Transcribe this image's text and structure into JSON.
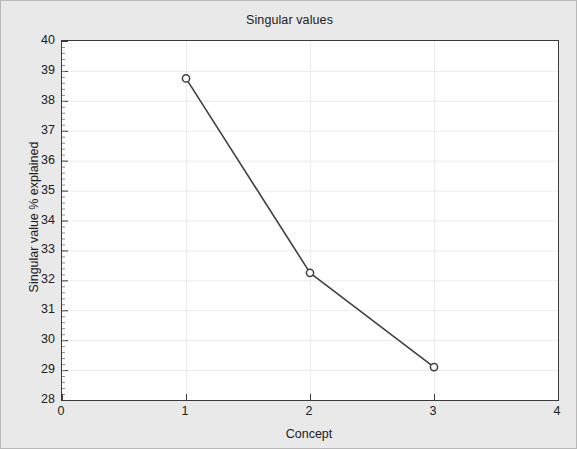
{
  "chart_data": {
    "type": "line",
    "title": "Singular values",
    "xlabel": "Concept",
    "ylabel": "Singular value % explained",
    "x": [
      1,
      2,
      3
    ],
    "values": [
      38.75,
      32.25,
      29.1
    ],
    "series": [
      {
        "name": "Singular value % explained",
        "x": [
          1,
          2,
          3
        ],
        "values": [
          38.75,
          32.25,
          29.1
        ]
      }
    ],
    "xlim": [
      0,
      4
    ],
    "ylim": [
      28,
      40
    ],
    "xticks": [
      "0",
      "1",
      "2",
      "3",
      "4"
    ],
    "xtick_values": [
      0,
      1,
      2,
      3,
      4
    ],
    "yticks": [
      "28",
      "29",
      "30",
      "31",
      "32",
      "33",
      "34",
      "35",
      "36",
      "37",
      "38",
      "39",
      "40"
    ],
    "ytick_values": [
      28,
      29,
      30,
      31,
      32,
      33,
      34,
      35,
      36,
      37,
      38,
      39,
      40
    ],
    "grid": true,
    "legend": false,
    "marker": "open-circle",
    "colors": {
      "line": "#404040",
      "marker_stroke": "#404040",
      "marker_fill": "#ffffff",
      "grid": "#ebebeb",
      "axis": "#3a3a3a",
      "figure_background": "#e9e9e9",
      "plot_background": "#ffffff",
      "text": "#202020"
    }
  }
}
